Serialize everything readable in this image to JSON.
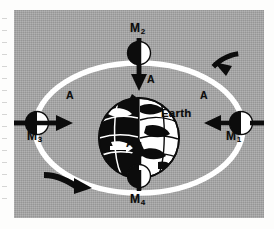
{
  "figure": {
    "kind": "orbital-diagram",
    "background_color": "#a6a6a6",
    "orbit_color": "#ffffff",
    "ink_color": "#0c0c0c"
  },
  "center_body": {
    "name": "Earth",
    "label": "Earth"
  },
  "orbit": {
    "shape": "ellipse",
    "stroke": "#ffffff",
    "direction": "counterclockwise"
  },
  "satellites": [
    {
      "id": "m1",
      "label": "M",
      "subscript": "1",
      "position": "right",
      "vector_label": "A",
      "vector_direction": "left"
    },
    {
      "id": "m2",
      "label": "M",
      "subscript": "2",
      "position": "top",
      "vector_label": "A",
      "vector_direction": "down"
    },
    {
      "id": "m3",
      "label": "M",
      "subscript": "3",
      "position": "left",
      "vector_label": "A",
      "vector_direction": "right"
    },
    {
      "id": "m4",
      "label": "M",
      "subscript": "4",
      "position": "bottom",
      "vector_label": "A",
      "vector_direction": "up"
    }
  ],
  "motion_arrows": [
    {
      "id": "arrow-top-right",
      "direction": "up-left",
      "meaning": "orbital travel direction"
    },
    {
      "id": "arrow-bottom-left",
      "direction": "down-right",
      "meaning": "orbital travel direction"
    }
  ]
}
